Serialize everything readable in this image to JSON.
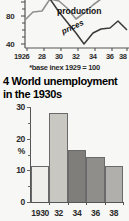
{
  "page": {
    "background_color": "#f7f7f5",
    "ink_color": "#1a1a1a"
  },
  "line_figure": {
    "name": "production-and-prices-index-line-chart",
    "note": "*base inex 1929 = 100",
    "y_axis": {
      "labels": [
        "80",
        "40"
      ],
      "visible_top_label_partial": "100"
    },
    "x_axis": {
      "labels": [
        "1926",
        "28",
        "30",
        "32",
        "34",
        "36",
        "38"
      ]
    },
    "series_labels": {
      "production": "production",
      "prices": "prices"
    },
    "colors": {
      "production_line": "#8f8f8f",
      "prices_line": "#3a3a3a",
      "axis": "#555555"
    },
    "chart_data": {
      "type": "line",
      "title": "",
      "xlabel": "",
      "ylabel": "",
      "note": "*base inex 1929 = 100",
      "x": [
        1926,
        1927,
        1928,
        1929,
        1930,
        1931,
        1932,
        1933,
        1934,
        1935,
        1936,
        1937,
        1938
      ],
      "xlim": [
        1926,
        1938
      ],
      "ylim": [
        30,
        110
      ],
      "tick_labels_y": [
        "80",
        "40"
      ],
      "tick_labels_x": [
        "1926",
        "28",
        "30",
        "32",
        "34",
        "36",
        "38"
      ],
      "grid": false,
      "legend": "inline-annotations",
      "series": [
        {
          "name": "production",
          "color": "#8f8f8f",
          "values": [
            72,
            83,
            84,
            100,
            98,
            88,
            74,
            80,
            90,
            97,
            106,
            110,
            100
          ]
        },
        {
          "name": "prices",
          "color": "#3a3a3a",
          "values": [
            97,
            96,
            98,
            100,
            84,
            70,
            57,
            40,
            51,
            56,
            57,
            63,
            75
          ]
        }
      ]
    }
  },
  "figure_title": {
    "number": "4",
    "text": "4 World unemployment in the 1930s"
  },
  "bar_figure": {
    "name": "world-unemployment-1930s-bar-chart",
    "y_axis": {
      "labels": [
        "30",
        "20",
        "%",
        "10",
        "0"
      ]
    },
    "x_axis": {
      "labels": [
        "1930",
        "32",
        "34",
        "36",
        "38"
      ]
    },
    "colors": {
      "bar_1930": "#f0eeea",
      "bar_1932": "#c9c7c2",
      "bar_1934": "#7f7e7b",
      "bar_1936": "#8f8e8a",
      "bar_1938": "#b0afab",
      "bar_outline": "#6a6a6a",
      "axis": "#555555"
    },
    "chart_data": {
      "type": "bar",
      "title": "4 World unemployment in the 1930s",
      "xlabel": "",
      "ylabel": "%",
      "categories": [
        "1930",
        "32",
        "34",
        "36",
        "38"
      ],
      "values": [
        11.7,
        29.0,
        17.0,
        14.8,
        11.6
      ],
      "ylim": [
        0,
        31
      ],
      "y_ticks": [
        0,
        10,
        20,
        30
      ],
      "y_minor_ticks": [
        5,
        15,
        25
      ],
      "grid": false,
      "bar_colors": [
        "#f0eeea",
        "#c9c7c2",
        "#7f7e7b",
        "#8f8e8a",
        "#b0afab"
      ]
    }
  }
}
